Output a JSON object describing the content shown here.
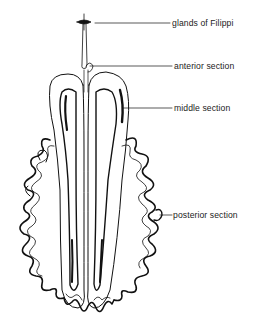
{
  "diagram": {
    "labels": [
      {
        "id": "glands-of-filippi",
        "text": "glands of Filippi"
      },
      {
        "id": "anterior-section",
        "text": "anterior section"
      },
      {
        "id": "middle-section",
        "text": "middle section"
      },
      {
        "id": "posterior-section",
        "text": "posterior section"
      }
    ]
  }
}
